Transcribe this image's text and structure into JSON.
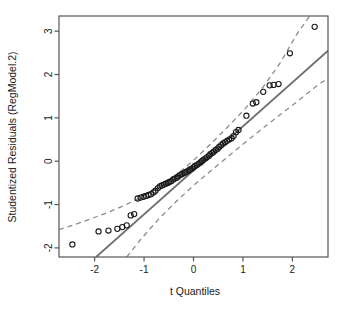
{
  "chart_data": {
    "type": "scatter",
    "title": "",
    "xlabel": "t Quantiles",
    "ylabel": "Studentized Residuals (RegModel.2)",
    "xlim": [
      -2.72,
      2.72
    ],
    "ylim": [
      -2.21,
      3.35
    ],
    "xticks": [
      -2,
      -1,
      0,
      1,
      2
    ],
    "xtick_labels": [
      "-2",
      "-1",
      "0",
      "1",
      "2"
    ],
    "yticks": [
      -2,
      -1,
      0,
      1,
      2,
      3
    ],
    "ytick_labels": [
      "-2",
      "-1",
      "0",
      "1",
      "2",
      "3"
    ],
    "grid": false,
    "legend": null,
    "colors": {
      "point_stroke": "#1a1a1a",
      "reference_line": "#707070",
      "confidence_band": "#8c8c8c",
      "axis": "#555555",
      "background": "#ffffff"
    },
    "series": [
      {
        "name": "Studentized residuals",
        "marker": "open-circle",
        "x": [
          -2.45,
          -1.92,
          -1.72,
          -1.54,
          -1.44,
          -1.35,
          -1.27,
          -1.2,
          -1.13,
          -1.07,
          -1.01,
          -0.96,
          -0.91,
          -0.86,
          -0.81,
          -0.77,
          -0.72,
          -0.68,
          -0.64,
          -0.6,
          -0.56,
          -0.52,
          -0.49,
          -0.45,
          -0.41,
          -0.38,
          -0.34,
          -0.31,
          -0.27,
          -0.24,
          -0.2,
          -0.17,
          -0.14,
          -0.1,
          -0.07,
          -0.03,
          0.0,
          0.03,
          0.07,
          0.1,
          0.14,
          0.17,
          0.2,
          0.24,
          0.27,
          0.31,
          0.34,
          0.38,
          0.41,
          0.45,
          0.49,
          0.52,
          0.56,
          0.6,
          0.64,
          0.68,
          0.72,
          0.77,
          0.81,
          0.86,
          0.91,
          1.07,
          1.2,
          1.27,
          1.41,
          1.54,
          1.62,
          1.72,
          1.95,
          2.45
        ],
        "y": [
          -1.92,
          -1.62,
          -1.6,
          -1.56,
          -1.52,
          -1.48,
          -1.25,
          -1.22,
          -0.86,
          -0.84,
          -0.82,
          -0.8,
          -0.78,
          -0.76,
          -0.72,
          -0.68,
          -0.62,
          -0.58,
          -0.56,
          -0.54,
          -0.52,
          -0.5,
          -0.48,
          -0.46,
          -0.42,
          -0.4,
          -0.38,
          -0.35,
          -0.32,
          -0.3,
          -0.28,
          -0.26,
          -0.24,
          -0.22,
          -0.19,
          -0.17,
          -0.14,
          -0.11,
          -0.09,
          -0.06,
          -0.03,
          0.0,
          0.03,
          0.06,
          0.09,
          0.12,
          0.16,
          0.19,
          0.22,
          0.26,
          0.29,
          0.33,
          0.37,
          0.41,
          0.44,
          0.47,
          0.5,
          0.53,
          0.58,
          0.67,
          0.72,
          1.05,
          1.33,
          1.36,
          1.6,
          1.75,
          1.76,
          1.78,
          2.49,
          3.1
        ]
      }
    ],
    "reference_line": {
      "name": "qq reference line",
      "style": "solid",
      "x": [
        -1.97,
        2.72
      ],
      "y": [
        -2.21,
        2.55
      ]
    },
    "confidence_bands": [
      {
        "name": "upper confidence envelope",
        "style": "dashed",
        "x": [
          -2.72,
          -2.45,
          -2.1,
          -1.75,
          -1.4,
          -1.05,
          -0.7,
          -0.35,
          0.0,
          0.35,
          0.7,
          1.05,
          1.4,
          1.75,
          2.1,
          2.35
        ],
        "y": [
          -1.58,
          -1.48,
          -1.34,
          -1.19,
          -1.02,
          -0.83,
          -0.6,
          -0.32,
          0.02,
          0.4,
          0.8,
          1.22,
          1.7,
          2.26,
          2.95,
          3.35
        ]
      },
      {
        "name": "lower confidence envelope",
        "style": "dashed",
        "x": [
          -1.35,
          -1.05,
          -0.7,
          -0.35,
          0.0,
          0.35,
          0.7,
          1.05,
          1.4,
          1.75,
          2.1,
          2.45,
          2.72
        ],
        "y": [
          -2.21,
          -1.78,
          -1.33,
          -0.93,
          -0.56,
          -0.22,
          0.11,
          0.44,
          0.76,
          1.07,
          1.38,
          1.7,
          1.92
        ]
      }
    ]
  }
}
